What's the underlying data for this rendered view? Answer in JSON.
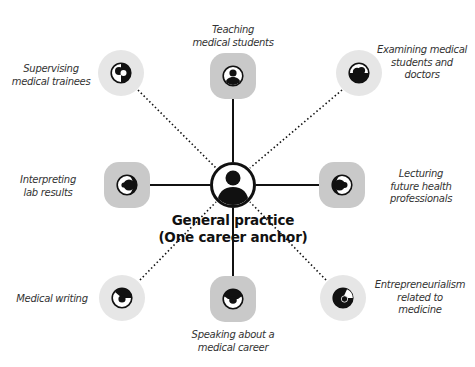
{
  "diagram": {
    "type": "hub-and-spoke",
    "center": {
      "title_line1": "General practice",
      "title_line2": "(One career anchor)",
      "icon": "person-icon"
    },
    "legend_semantics": {
      "solid_line": "solid connector with darker rounded-square node",
      "dotted_line": "dotted connector with lighter circular node"
    },
    "colors": {
      "square_node": "#c9c9c9",
      "blob_node": "#e6e6e6",
      "line": "#111111",
      "text": "#333333"
    },
    "nodes": [
      {
        "id": "top",
        "label_lines": [
          "Teaching",
          "medical students"
        ],
        "connector": "solid",
        "shape": "square",
        "icon": "person-icon"
      },
      {
        "id": "top-right",
        "label_lines": [
          "Examining medical",
          "students and",
          "doctors"
        ],
        "connector": "dotted",
        "shape": "circle",
        "icon": "pie-icon"
      },
      {
        "id": "right",
        "label_lines": [
          "Lecturing",
          "future health",
          "professionals"
        ],
        "connector": "solid",
        "shape": "square",
        "icon": "pie-icon"
      },
      {
        "id": "bottom-right",
        "label_lines": [
          "Entrepreneurialism",
          "related to",
          "medicine"
        ],
        "connector": "dotted",
        "shape": "circle",
        "icon": "pie-icon"
      },
      {
        "id": "bottom",
        "label_lines": [
          "Speaking about a",
          "medical career"
        ],
        "connector": "solid",
        "shape": "square",
        "icon": "pie-icon"
      },
      {
        "id": "bottom-left",
        "label_lines": [
          "Medical writing"
        ],
        "connector": "dotted",
        "shape": "circle",
        "icon": "pie-icon"
      },
      {
        "id": "left",
        "label_lines": [
          "Interpreting",
          "lab results"
        ],
        "connector": "solid",
        "shape": "square",
        "icon": "pie-icon"
      },
      {
        "id": "top-left",
        "label_lines": [
          "Supervising",
          "medical trainees"
        ],
        "connector": "dotted",
        "shape": "circle",
        "icon": "pie-icon"
      }
    ]
  }
}
